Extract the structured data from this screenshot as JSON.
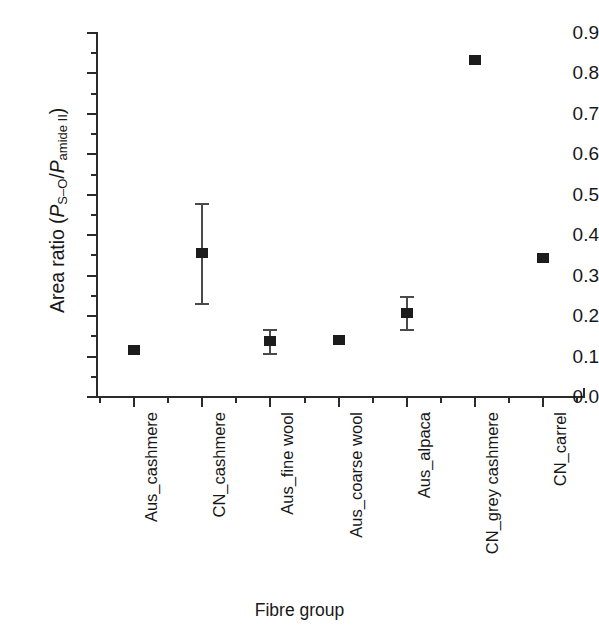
{
  "chart_data": {
    "type": "scatter",
    "title": "",
    "xlabel": "Fibre group",
    "ylabel": "Area ratio (P_S-O/P_amide II)",
    "ylabel_parts": {
      "prefix": "Area ratio (",
      "p1": "P",
      "sub1": "S–O",
      "slash": "/",
      "p2": "P",
      "sub2": "amide II",
      "suffix": ")"
    },
    "categories": [
      "Aus_cashmere",
      "CN_cashmere",
      "Aus_fine wool",
      "Aus_coarse wool",
      "Aus_alpaca",
      "CN_grey cashmere",
      "CN_carrel"
    ],
    "values": [
      0.115,
      0.355,
      0.138,
      0.142,
      0.208,
      0.833,
      0.343
    ],
    "error_upper": [
      0.0,
      0.125,
      0.03,
      0.0,
      0.042,
      0.0,
      0.0
    ],
    "error_lower": [
      0.0,
      0.122,
      0.03,
      0.0,
      0.04,
      0.0,
      0.0
    ],
    "ylim": [
      0.0,
      0.9
    ],
    "ytick_labels": [
      "0.0",
      "0.1",
      "0.2",
      "0.3",
      "0.4",
      "0.5",
      "0.6",
      "0.7",
      "0.8",
      "0.9"
    ],
    "ytick_values": [
      0.0,
      0.1,
      0.2,
      0.3,
      0.4,
      0.5,
      0.6,
      0.7,
      0.8,
      0.9
    ],
    "yminor_step": 0.05,
    "grid": false,
    "legend": "none",
    "marker_color": "#1c1c1c",
    "marker_shape": "square",
    "axis_color": "#2b2b2b"
  }
}
